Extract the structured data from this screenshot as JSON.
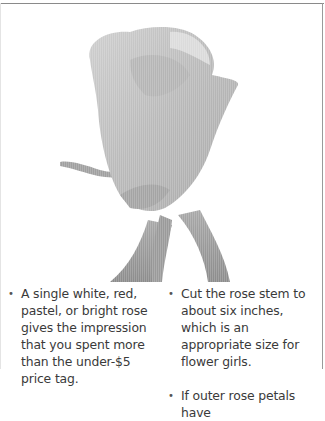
{
  "photo": {
    "subject": "rose-photo",
    "description": "Single grayscale rose bud with stem and leaves"
  },
  "columns": [
    {
      "items": [
        {
          "bullet": "•",
          "text": "A single white, red, pastel, or bright rose gives the impression that you spent more than the under-$5 price tag."
        }
      ]
    },
    {
      "items": [
        {
          "bullet": "•",
          "text": "Cut the rose stem to about six inches, which is an appropriate size for flower girls."
        },
        {
          "bullet": "•",
          "text": "If outer rose petals have"
        }
      ]
    }
  ]
}
